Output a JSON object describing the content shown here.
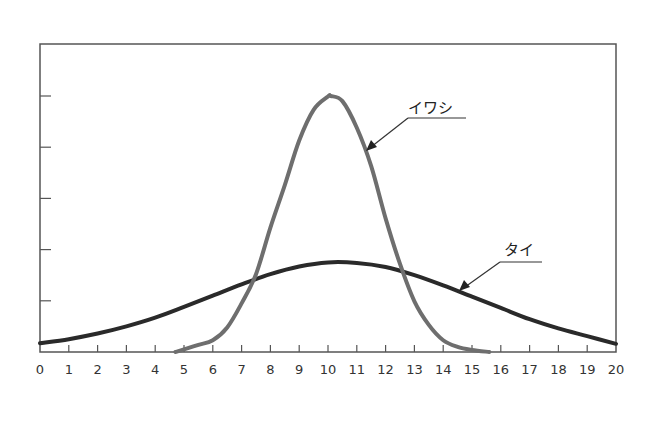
{
  "chart_data": {
    "type": "line",
    "title": "",
    "xlabel": "",
    "ylabel": "",
    "xlim": [
      0,
      20
    ],
    "ylim": [
      0,
      6
    ],
    "x_ticks": [
      0,
      1,
      2,
      3,
      4,
      5,
      6,
      7,
      8,
      9,
      10,
      11,
      12,
      13,
      14,
      15,
      16,
      17,
      18,
      19,
      20
    ],
    "y_ticks": [
      1,
      2,
      3,
      4,
      5
    ],
    "y_tick_labels_shown": false,
    "grid": false,
    "legend": "annotations",
    "series": [
      {
        "name": "イワシ",
        "color": "#6e6e6e",
        "x": [
          4.7,
          5,
          5.5,
          6,
          6.5,
          7,
          7.5,
          8,
          8.5,
          9,
          9.5,
          10,
          10.1,
          10.5,
          11,
          11.5,
          12,
          12.5,
          13,
          13.5,
          14,
          14.5,
          15,
          15.6
        ],
        "values": [
          0.0,
          0.05,
          0.14,
          0.23,
          0.48,
          0.95,
          1.52,
          2.43,
          3.26,
          4.13,
          4.73,
          4.99,
          5.0,
          4.9,
          4.38,
          3.63,
          2.61,
          1.72,
          0.99,
          0.53,
          0.23,
          0.1,
          0.04,
          0.0
        ]
      },
      {
        "name": "タイ",
        "color": "#2a2a2a",
        "x": [
          0,
          1,
          2,
          3,
          4,
          5,
          6,
          7,
          8,
          9,
          10,
          11,
          12,
          13,
          14,
          15,
          16,
          17,
          18,
          19,
          20
        ],
        "values": [
          0.17,
          0.25,
          0.36,
          0.5,
          0.67,
          0.88,
          1.1,
          1.32,
          1.52,
          1.67,
          1.75,
          1.74,
          1.66,
          1.5,
          1.3,
          1.08,
          0.86,
          0.64,
          0.46,
          0.31,
          0.16
        ]
      }
    ],
    "annotations": [
      {
        "text": "イワシ",
        "points_to": "イワシ",
        "at_x": 11.4
      },
      {
        "text": "タイ",
        "points_to": "タイ",
        "at_x": 14.5
      }
    ]
  }
}
